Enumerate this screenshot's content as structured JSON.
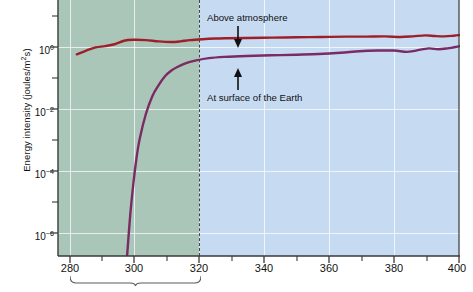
{
  "chart_data": {
    "type": "line",
    "title": "",
    "xlabel": "",
    "ylabel": "Energy intensity (joules/m²s)",
    "xlim": [
      272,
      400
    ],
    "ylim_log10": [
      -6.9,
      1.2
    ],
    "xticks": [
      280,
      300,
      320,
      340,
      360,
      380,
      400
    ],
    "yticks_label": [
      "10⁰",
      "10⁻²",
      "10⁻⁴",
      "10⁻⁶"
    ],
    "yticks_log10": [
      0,
      -2,
      -4,
      -6
    ],
    "grid": true,
    "legend_position": "inline-annotations",
    "x_unit_note": "wavelength (nanometres)",
    "regions": [
      {
        "name": "uv-b-region",
        "x_start": 272,
        "x_end": 320,
        "color": "#a9c6b9"
      },
      {
        "name": "uv-a-region",
        "x_start": 320,
        "x_end": 400,
        "color": "#c6dbf2"
      }
    ],
    "divider_x": 320,
    "series": [
      {
        "name": "Above atmosphere",
        "color": "#9e1f29",
        "points": [
          [
            278,
            -0.52
          ],
          [
            281,
            -0.4
          ],
          [
            284,
            -0.3
          ],
          [
            287,
            -0.26
          ],
          [
            290,
            -0.2
          ],
          [
            293,
            -0.09
          ],
          [
            296,
            -0.06
          ],
          [
            300,
            -0.07
          ],
          [
            304,
            -0.11
          ],
          [
            308,
            -0.13
          ],
          [
            311,
            -0.11
          ],
          [
            314,
            -0.07
          ],
          [
            318,
            -0.04
          ],
          [
            322,
            -0.02
          ],
          [
            326,
            -0.01
          ],
          [
            332,
            0.0
          ],
          [
            340,
            0.01
          ],
          [
            348,
            0.02
          ],
          [
            356,
            0.03
          ],
          [
            364,
            0.04
          ],
          [
            370,
            0.04
          ],
          [
            376,
            0.05
          ],
          [
            381,
            0.03
          ],
          [
            385,
            0.05
          ],
          [
            389,
            0.08
          ],
          [
            392,
            0.06
          ],
          [
            395,
            0.05
          ],
          [
            398,
            0.07
          ],
          [
            400,
            0.09
          ]
        ]
      },
      {
        "name": "At surface of the Earth",
        "color": "#7b2b63",
        "points": [
          [
            294,
            -6.9
          ],
          [
            295,
            -5.6
          ],
          [
            296,
            -4.6
          ],
          [
            297,
            -3.8
          ],
          [
            298,
            -3.2
          ],
          [
            300,
            -2.4
          ],
          [
            302,
            -1.85
          ],
          [
            304,
            -1.5
          ],
          [
            306,
            -1.22
          ],
          [
            308,
            -1.04
          ],
          [
            310,
            -0.92
          ],
          [
            313,
            -0.79
          ],
          [
            316,
            -0.71
          ],
          [
            320,
            -0.64
          ],
          [
            325,
            -0.6
          ],
          [
            332,
            -0.57
          ],
          [
            340,
            -0.55
          ],
          [
            348,
            -0.53
          ],
          [
            355,
            -0.51
          ],
          [
            362,
            -0.47
          ],
          [
            368,
            -0.42
          ],
          [
            374,
            -0.4
          ],
          [
            379,
            -0.4
          ],
          [
            383,
            -0.44
          ],
          [
            386,
            -0.4
          ],
          [
            390,
            -0.33
          ],
          [
            393,
            -0.36
          ],
          [
            396,
            -0.33
          ],
          [
            400,
            -0.26
          ]
        ]
      }
    ],
    "annotations": [
      {
        "name": "above-atmosphere",
        "text": "Above atmosphere",
        "arrow": "down",
        "target_series": "Above atmosphere"
      },
      {
        "name": "at-surface",
        "text": "At surface of the Earth",
        "arrow": "up",
        "target_series": "At surface of the Earth"
      }
    ],
    "brackets": [
      {
        "name": "uv-bracket",
        "x_start": 280,
        "x_end": 320
      }
    ]
  },
  "axes": {
    "y_title": "Energy intensity (joules/m",
    "y_title_sup": "2",
    "y_title_tail": "s)",
    "y_tick_labels": [
      {
        "mantissa": "10",
        "exponent": "0"
      },
      {
        "mantissa": "10",
        "exponent": "−2"
      },
      {
        "mantissa": "10",
        "exponent": "−4"
      },
      {
        "mantissa": "10",
        "exponent": "−6"
      }
    ],
    "x_tick_labels": [
      "280",
      "300",
      "320",
      "340",
      "360",
      "380",
      "400"
    ]
  },
  "labels": {
    "above_atmosphere": "Above atmosphere",
    "at_surface": "At surface of the Earth"
  },
  "colors": {
    "series_above": "#9e1f29",
    "series_surface": "#7b2b63",
    "band_green": "#a9c6b9",
    "band_blue": "#c6dbf2",
    "divider": "#3d4450",
    "axis": "#3a3a3a"
  }
}
